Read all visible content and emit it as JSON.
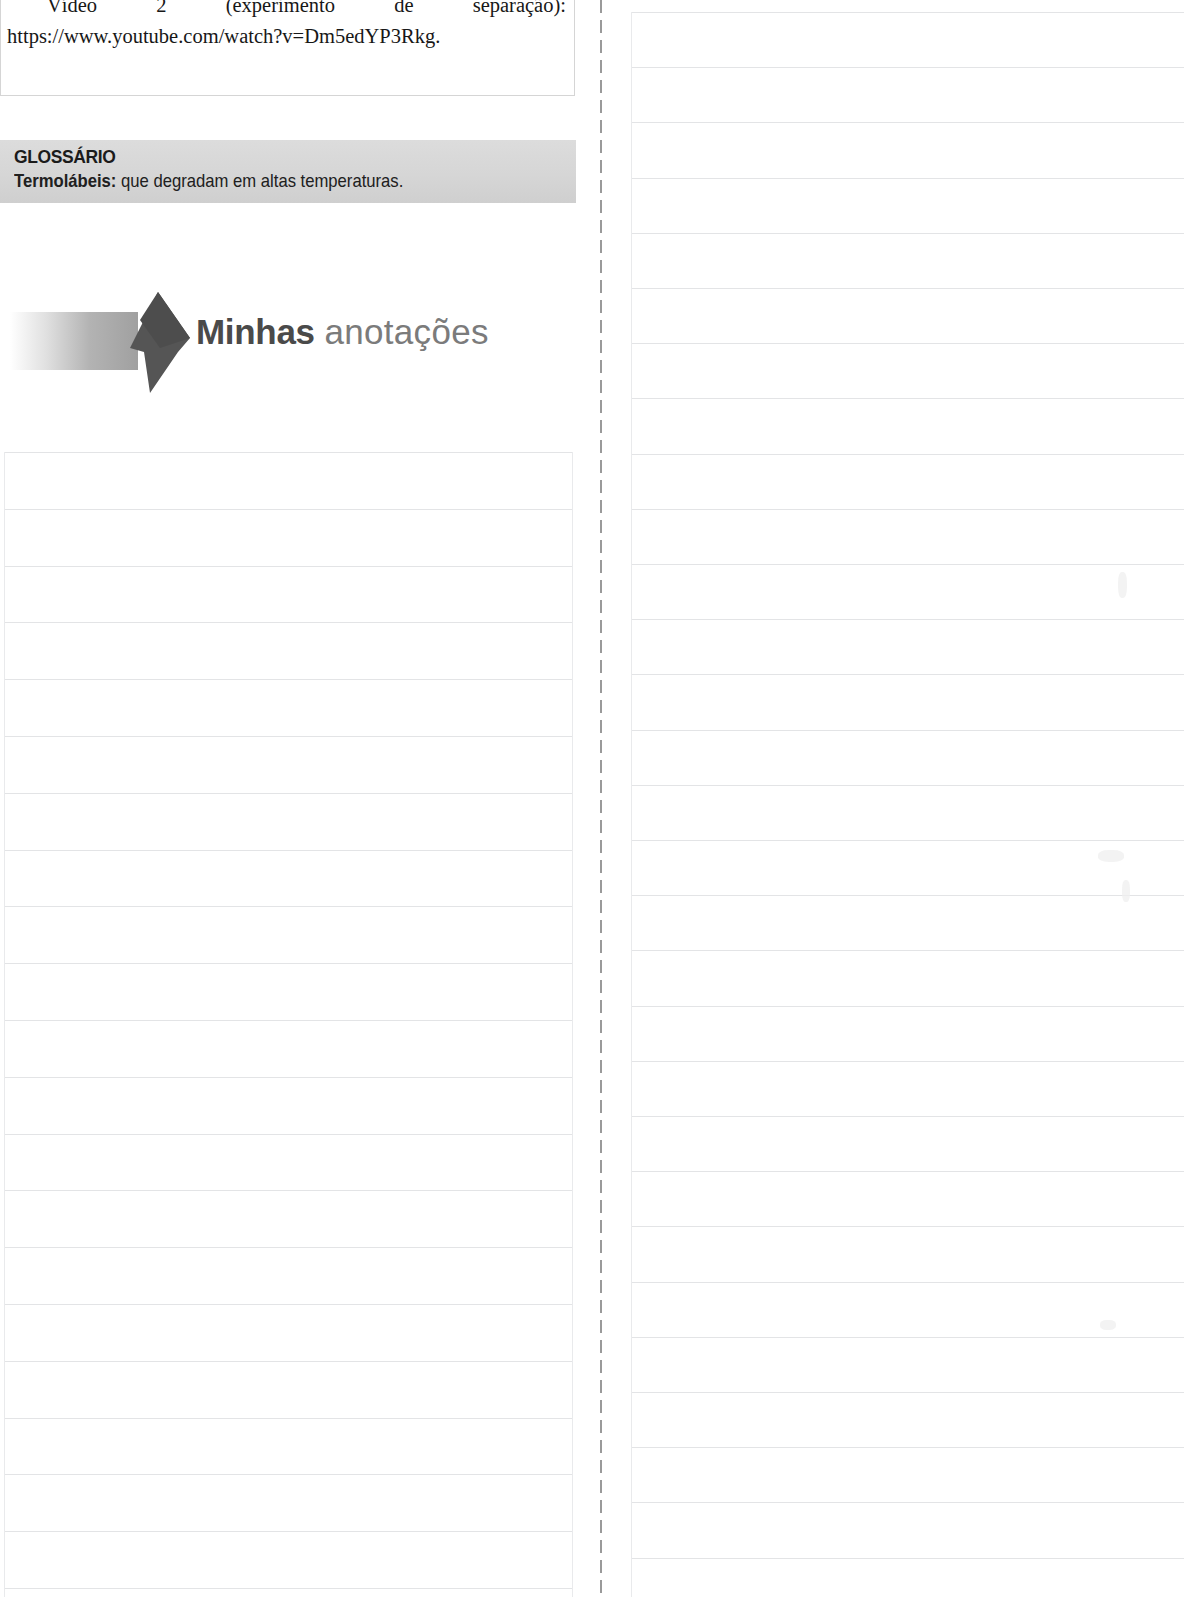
{
  "page": {
    "width": 1184,
    "height": 1597,
    "background": "#ffffff"
  },
  "video_box": {
    "name": "video-references-box",
    "clipped_line": "watch?v=1OL6yhGYmzA.",
    "paragraph": "Vídeo 2 (experimento de separação): https://www.youtube.com/watch?v=Dm5edYP3Rkg."
  },
  "glossary": {
    "title": "GLOSSÁRIO",
    "term": "Termolábeis:",
    "definition": "que degradam em altas temperaturas.",
    "band_color": "#d6d6d6"
  },
  "banner": {
    "title_bold": "Minhas",
    "title_light": "anotações",
    "arrow_color": "#555555",
    "bar_color": "#a0a0a0",
    "bold_text_color": "#4a4a4a",
    "light_text_color": "#7b7b7b"
  },
  "notes_left": {
    "name": "left-note-lines",
    "left": 4,
    "top": 452,
    "width": 568,
    "line_count": 21,
    "line_spacing": 56.8,
    "line_color": "#e3e4e6"
  },
  "notes_right": {
    "name": "right-note-lines",
    "left": 631,
    "top": 12,
    "width": 553,
    "line_count": 29,
    "line_spacing": 55.2,
    "line_color": "#e3e4e6"
  },
  "fold": {
    "name": "center-fold-dashed-line",
    "x": 600,
    "color": "#9a9a9a",
    "dash": 13,
    "gap": 7
  }
}
